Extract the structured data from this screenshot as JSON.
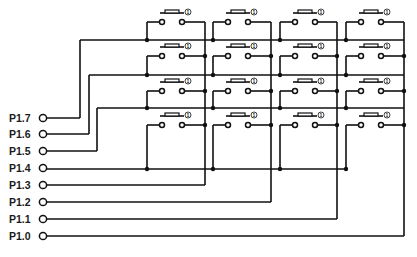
{
  "diagram": {
    "ports": [
      {
        "label": "P1.7",
        "role": "row",
        "index": 0
      },
      {
        "label": "P1.6",
        "role": "row",
        "index": 1
      },
      {
        "label": "P1.5",
        "role": "row",
        "index": 2
      },
      {
        "label": "P1.4",
        "role": "row",
        "index": 3
      },
      {
        "label": "P1.3",
        "role": "column",
        "index": 0
      },
      {
        "label": "P1.2",
        "role": "column",
        "index": 1
      },
      {
        "label": "P1.1",
        "role": "column",
        "index": 2
      },
      {
        "label": "P1.0",
        "role": "column",
        "index": 3
      }
    ],
    "switch_marker": "①",
    "grid": {
      "rows": 4,
      "columns": 4
    },
    "colors": {
      "wire": "#111111",
      "background": "#ffffff"
    }
  }
}
